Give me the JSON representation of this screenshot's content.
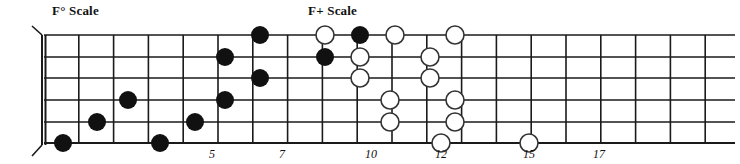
{
  "diagram": {
    "type": "guitar-fretboard",
    "title_left": "F° Scale",
    "title_right": "F+ Scale",
    "string_count": 6,
    "fret_count": 19,
    "colors": {
      "line": "#1a1a1a",
      "filled_dot": "#111111",
      "open_dot_fill": "#ffffff",
      "open_dot_stroke": "#333333",
      "text": "#111111"
    },
    "labels": [
      {
        "name": "left-scale-label",
        "text": "F° Scale",
        "x": 52,
        "y": 3
      },
      {
        "name": "right-scale-label",
        "text": "F+ Scale",
        "x": 308,
        "y": 3
      }
    ],
    "fret_markers": [
      {
        "label": "5",
        "fret": 5,
        "x": 212
      },
      {
        "label": "7",
        "fret": 7,
        "x": 282
      },
      {
        "label": "10",
        "fret": 10,
        "x": 371
      },
      {
        "label": "12",
        "fret": 12,
        "x": 441
      },
      {
        "label": "15",
        "fret": 15,
        "x": 529
      },
      {
        "label": "17",
        "fret": 17,
        "x": 599
      }
    ],
    "geometry": {
      "nut_x": 44,
      "first_fret_x": 44,
      "fret_spacing": 34.8,
      "string_ys": [
        35,
        57,
        78,
        100,
        122,
        143
      ],
      "board_right": 735,
      "dot_radius_filled": 9,
      "dot_radius_open": 9
    },
    "notes_filled": [
      {
        "string": 6,
        "fret": 1,
        "x": 63,
        "y": 143
      },
      {
        "string": 5,
        "fret": 2,
        "x": 97,
        "y": 122
      },
      {
        "string": 4,
        "fret": 3,
        "x": 128,
        "y": 100
      },
      {
        "string": 6,
        "fret": 4,
        "x": 160,
        "y": 143
      },
      {
        "string": 5,
        "fret": 5,
        "x": 195,
        "y": 122
      },
      {
        "string": 4,
        "fret": 6,
        "x": 225,
        "y": 100
      },
      {
        "string": 2,
        "fret": 6,
        "x": 225,
        "y": 57
      },
      {
        "string": 1,
        "fret": 7,
        "x": 260,
        "y": 35
      },
      {
        "string": 3,
        "fret": 7,
        "x": 260,
        "y": 78
      },
      {
        "string": 2,
        "fret": 9,
        "x": 325,
        "y": 57
      },
      {
        "string": 1,
        "fret": 10,
        "x": 360,
        "y": 35
      }
    ],
    "notes_open": [
      {
        "string": 1,
        "fret": 9,
        "x": 325,
        "y": 35
      },
      {
        "string": 1,
        "fret": 11,
        "x": 395,
        "y": 35
      },
      {
        "string": 2,
        "fret": 10,
        "x": 360,
        "y": 57
      },
      {
        "string": 3,
        "fret": 10,
        "x": 360,
        "y": 78
      },
      {
        "string": 1,
        "fret": 13,
        "x": 455,
        "y": 35
      },
      {
        "string": 2,
        "fret": 12,
        "x": 430,
        "y": 57
      },
      {
        "string": 3,
        "fret": 12,
        "x": 430,
        "y": 78
      },
      {
        "string": 4,
        "fret": 11,
        "x": 390,
        "y": 100
      },
      {
        "string": 4,
        "fret": 13,
        "x": 455,
        "y": 100
      },
      {
        "string": 5,
        "fret": 11,
        "x": 390,
        "y": 122
      },
      {
        "string": 5,
        "fret": 13,
        "x": 455,
        "y": 122
      },
      {
        "string": 6,
        "fret": 12,
        "x": 441,
        "y": 143
      },
      {
        "string": 6,
        "fret": 15,
        "x": 529,
        "y": 143
      }
    ]
  }
}
